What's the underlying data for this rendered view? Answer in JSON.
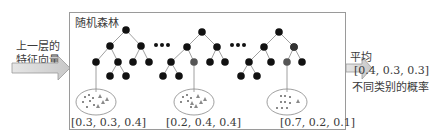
{
  "title": "随机森林",
  "input_label": [
    "上一层的",
    "特征向量"
  ],
  "output_label": "平均",
  "output_vector": "[0.4, 0.3, 0.3]",
  "output_caption": "不同类别的概率",
  "ellipsis": "• • •",
  "trees": [
    {
      "name": "tree-1",
      "probabilities": "[0.3, 0.3, 0.4]"
    },
    {
      "name": "tree-2",
      "probabilities": "[0.2, 0.4, 0.4]"
    },
    {
      "name": "tree-3",
      "probabilities": "[0.7, 0.2, 0.1]"
    }
  ],
  "colors": {
    "node": "#111111",
    "leaf_node": "#555555",
    "edge": "#888888",
    "arrow_fill": "#d4d4d4",
    "sample_marker": "#8a8a8a",
    "border": "#9a9a9a"
  }
}
